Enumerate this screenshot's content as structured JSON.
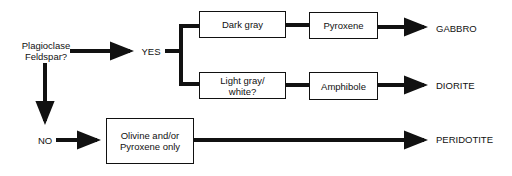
{
  "diagram": {
    "type": "flowchart",
    "question": {
      "line1": "Plagioclase",
      "line2": "Feldspar?"
    },
    "answers": {
      "yes": "YES",
      "no": "NO"
    },
    "boxes": {
      "dark_gray": "Dark gray",
      "light_gray": {
        "line1": "Light gray/",
        "line2": "white?"
      },
      "pyroxene": "Pyroxene",
      "amphibole": "Amphibole",
      "olivine": {
        "line1": "Olivine and/or",
        "line2": "Pyroxene only"
      }
    },
    "results": {
      "gabbro": "GABBRO",
      "diorite": "DIORITE",
      "peridotite": "PERIDOTITE"
    },
    "colors": {
      "line": "#111111",
      "background": "#ffffff"
    }
  }
}
